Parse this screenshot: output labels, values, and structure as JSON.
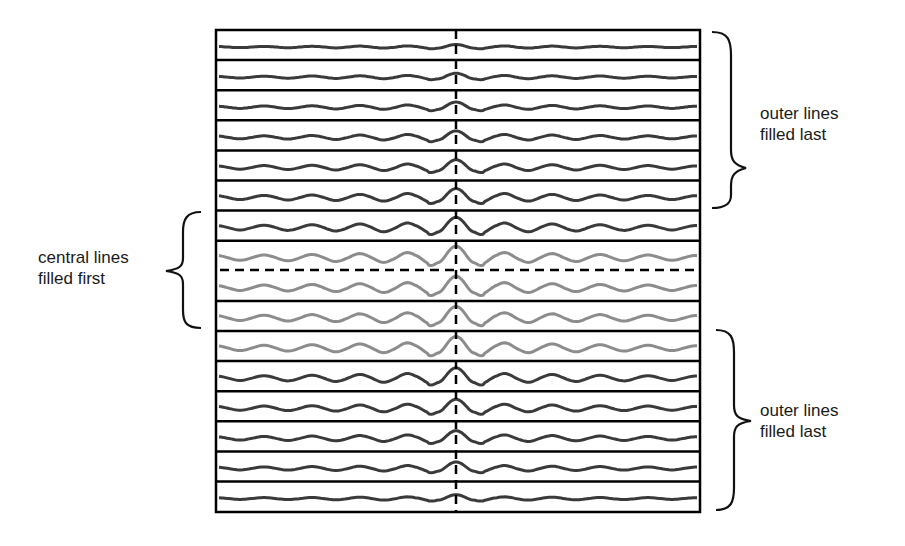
{
  "diagram": {
    "title": "",
    "box": {
      "x": 216,
      "y": 30,
      "width": 484,
      "height": 482
    },
    "row_count": 16,
    "row_height": 30.1,
    "center_x": 456,
    "colors": {
      "outer_wave": "#3a3a3a",
      "central_wave": "#8c8c8c",
      "grid": "#000000"
    },
    "rows": [
      {
        "index": 0,
        "group": "outer",
        "amplitude": 2
      },
      {
        "index": 1,
        "group": "outer",
        "amplitude": 3
      },
      {
        "index": 2,
        "group": "outer",
        "amplitude": 4
      },
      {
        "index": 3,
        "group": "outer",
        "amplitude": 5
      },
      {
        "index": 4,
        "group": "outer",
        "amplitude": 6
      },
      {
        "index": 5,
        "group": "outer",
        "amplitude": 7
      },
      {
        "index": 6,
        "group": "outer",
        "amplitude": 8
      },
      {
        "index": 7,
        "group": "central",
        "amplitude": 9
      },
      {
        "index": 8,
        "group": "central",
        "amplitude": 9
      },
      {
        "index": 9,
        "group": "central",
        "amplitude": 9
      },
      {
        "index": 10,
        "group": "central",
        "amplitude": 9
      },
      {
        "index": 11,
        "group": "outer",
        "amplitude": 8
      },
      {
        "index": 12,
        "group": "outer",
        "amplitude": 7
      },
      {
        "index": 13,
        "group": "outer",
        "amplitude": 6
      },
      {
        "index": 14,
        "group": "outer",
        "amplitude": 5
      },
      {
        "index": 15,
        "group": "outer",
        "amplitude": 3
      }
    ],
    "annotations": {
      "top_right": {
        "line1": "outer lines",
        "line2": "filled last"
      },
      "left": {
        "line1": "central lines",
        "line2": "filled first"
      },
      "bottom_right": {
        "line1": "outer lines",
        "line2": "filled last"
      }
    }
  }
}
